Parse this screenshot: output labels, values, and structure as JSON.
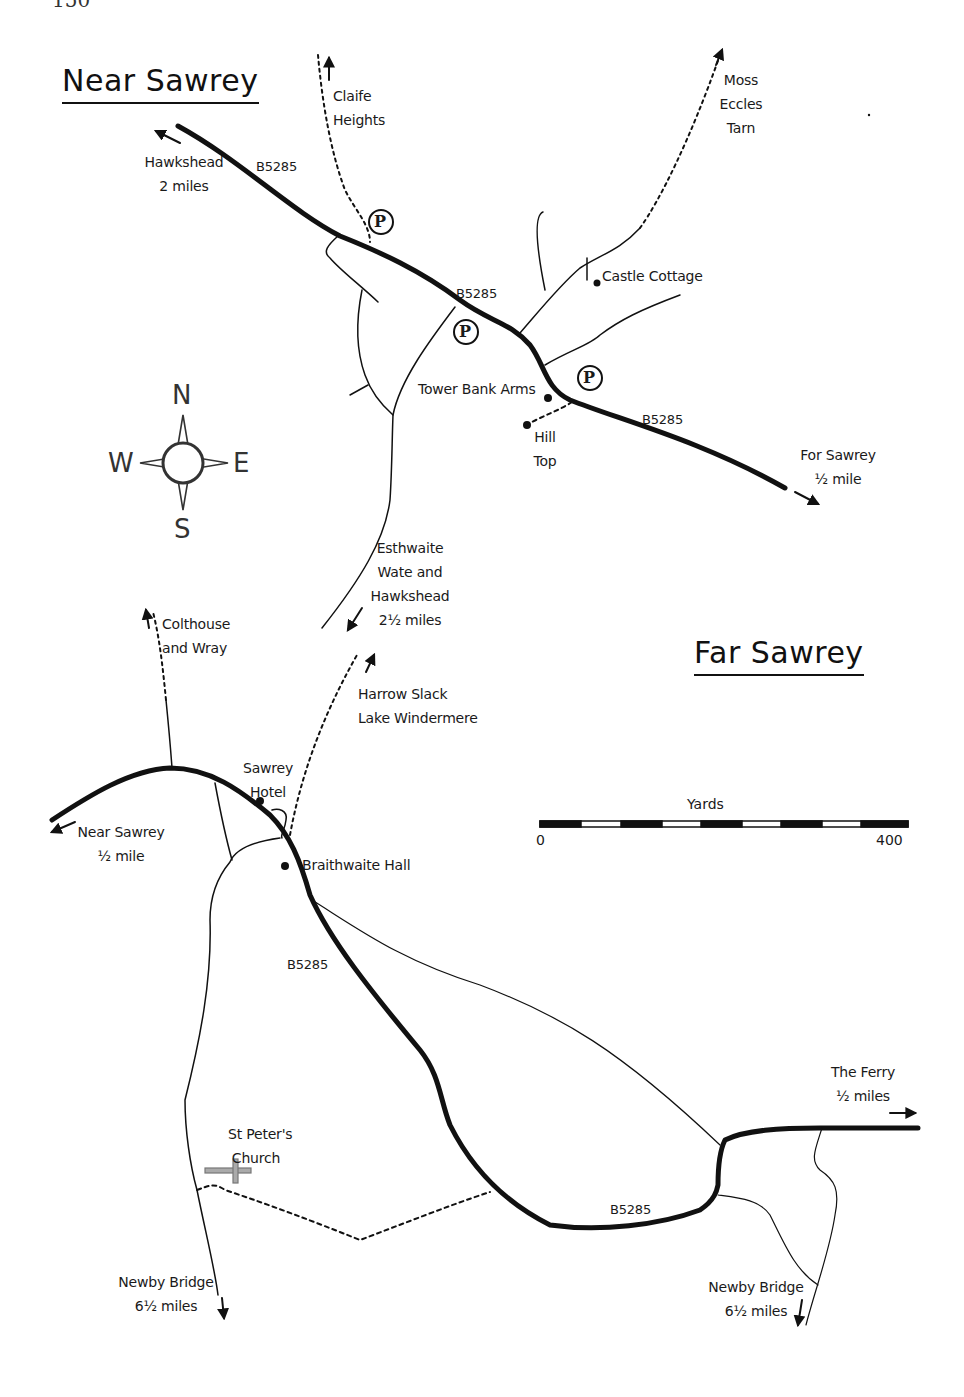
{
  "page": {
    "number": "150"
  },
  "titles": {
    "near_sawrey": "Near Sawrey",
    "far_sawrey": "Far Sawrey"
  },
  "compass": {
    "north": "N",
    "south": "S",
    "east": "E",
    "west": "W"
  },
  "scale_bar": {
    "unit": "Yards",
    "min": "0",
    "max": "400",
    "segments": 9
  },
  "near_sawrey": {
    "road_labels": [
      "B5285",
      "B5285",
      "B5285"
    ],
    "destinations": {
      "hawkshead": {
        "line1": "Hawkshead",
        "line2": "2 miles"
      },
      "claife": {
        "line1": "Claife",
        "line2": "Heights"
      },
      "moss_eccles": {
        "line1": "Moss",
        "line2": "Eccles",
        "line3": "Tarn"
      },
      "far_sawrey": {
        "line1": "For Sawrey",
        "line2": "½ mile"
      },
      "esthwaite": {
        "line1": "Esthwaite",
        "line2": "Wate and",
        "line3": "Hawkshead",
        "line4": "2½ miles"
      }
    },
    "places": {
      "castle_cottage": "Castle Cottage",
      "tower_bank_arms": "Tower Bank Arms",
      "hill_top": {
        "line1": "Hill",
        "line2": "Top"
      }
    },
    "parking": [
      "P",
      "P",
      "P"
    ]
  },
  "far_sawrey": {
    "road_labels": [
      "B5285",
      "B5285"
    ],
    "destinations": {
      "colthouse": {
        "line1": "Colthouse",
        "line2": "and Wray"
      },
      "harrow_slack": {
        "line1": "Harrow Slack",
        "line2": "Lake Windermere"
      },
      "near_sawrey": {
        "line1": "Near Sawrey",
        "line2": "½ mile"
      },
      "the_ferry": {
        "line1": "The Ferry",
        "line2": "½ miles"
      },
      "newby_bridge_west": {
        "line1": "Newby Bridge",
        "line2": "6½ miles"
      },
      "newby_bridge_east": {
        "line1": "Newby Bridge",
        "line2": "6½ miles"
      }
    },
    "places": {
      "sawrey_hotel": {
        "line1": "Sawrey",
        "line2": "Hotel"
      },
      "braithwaite_hall": "Braithwaite Hall",
      "st_peters": {
        "line1": "St Peter's",
        "line2": "Church"
      }
    }
  },
  "colors": {
    "ink": "#111111",
    "church": "#8a8a8a",
    "paper": "#ffffff"
  }
}
